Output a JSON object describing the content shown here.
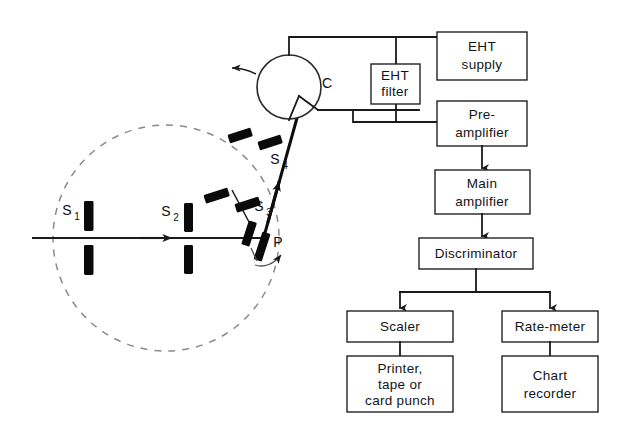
{
  "figure": {
    "type": "diagram",
    "background_color": "#ffffff",
    "line_color": "#1a1a1a",
    "dashed_circle_color": "#8a8a8a"
  },
  "optics": {
    "incident_beam_label": "incident-beam",
    "specimen": {
      "label": "P",
      "name": "specimen"
    },
    "detector": {
      "label": "C",
      "name": "counter"
    },
    "slits": [
      {
        "id": "s1",
        "label": "S",
        "subscript": "1",
        "name": "divergence-slit"
      },
      {
        "id": "s2",
        "label": "S",
        "subscript": "2",
        "name": "scatter-slit"
      },
      {
        "id": "s3",
        "label": "S",
        "subscript": "3",
        "name": "receiving-slit"
      },
      {
        "id": "s4",
        "label": "S",
        "subscript": "4",
        "name": "detector-slit"
      }
    ],
    "focusing_circle_name": "focusing-circle",
    "rotation_arrow_name": "detector-rotation-arrow",
    "specimen_rotation_arrow_name": "specimen-rotation-arrow"
  },
  "blocks": [
    {
      "id": "eht_supply",
      "label": "EHT\nsupply",
      "lines": [
        "EHT",
        "supply"
      ]
    },
    {
      "id": "eht_filter",
      "label": "EHT\nfilter",
      "lines": [
        "EHT",
        "filter"
      ]
    },
    {
      "id": "preamp",
      "label": "Pre-\namplifier",
      "lines": [
        "Pre-",
        "amplifier"
      ]
    },
    {
      "id": "mainamp",
      "label": "Main\namplifier",
      "lines": [
        "Main",
        "amplifier"
      ]
    },
    {
      "id": "discriminator",
      "label": "Discriminator",
      "lines": [
        "Discriminator"
      ]
    },
    {
      "id": "scaler",
      "label": "Scaler",
      "lines": [
        "Scaler"
      ]
    },
    {
      "id": "ratemeter",
      "label": "Rate-meter",
      "lines": [
        "Rate-meter"
      ]
    },
    {
      "id": "printer",
      "label": "Printer,\ntape or\ncard punch",
      "lines": [
        "Printer,",
        "tape or",
        "card punch"
      ]
    },
    {
      "id": "chartrec",
      "label": "Chart\nrecorder",
      "lines": [
        "Chart",
        "recorder"
      ]
    }
  ],
  "block_text": {
    "eht_supply_l1": "EHT",
    "eht_supply_l2": "supply",
    "eht_filter_l1": "EHT",
    "eht_filter_l2": "filter",
    "preamp_l1": "Pre-",
    "preamp_l2": "amplifier",
    "mainamp_l1": "Main",
    "mainamp_l2": "amplifier",
    "discriminator_l1": "Discriminator",
    "scaler_l1": "Scaler",
    "ratemeter_l1": "Rate-meter",
    "printer_l1": "Printer,",
    "printer_l2": "tape or",
    "printer_l3": "card punch",
    "chartrec_l1": "Chart",
    "chartrec_l2": "recorder"
  },
  "part_text": {
    "counter": "C",
    "specimen": "P",
    "s_letter": "S",
    "s1_sub": "1",
    "s2_sub": "2",
    "s3_sub": "3",
    "s4_sub": "4"
  },
  "connections": [
    {
      "from": "counter",
      "to": "eht_filter",
      "name": "counter-to-eht-filter"
    },
    {
      "from": "counter",
      "to": "eht_supply",
      "name": "counter-to-eht-supply"
    },
    {
      "from": "eht_filter",
      "to": "eht_supply",
      "name": "eht-filter-to-supply"
    },
    {
      "from": "eht_filter",
      "to": "preamp",
      "name": "eht-filter-to-preamp"
    },
    {
      "from": "preamp",
      "to": "mainamp",
      "name": "preamp-to-mainamp"
    },
    {
      "from": "mainamp",
      "to": "discriminator",
      "name": "mainamp-to-discriminator"
    },
    {
      "from": "discriminator",
      "to": "scaler",
      "name": "discriminator-to-scaler"
    },
    {
      "from": "discriminator",
      "to": "ratemeter",
      "name": "discriminator-to-ratemeter"
    },
    {
      "from": "scaler",
      "to": "printer",
      "name": "scaler-to-printer"
    },
    {
      "from": "ratemeter",
      "to": "chartrec",
      "name": "ratemeter-to-chart-recorder"
    }
  ]
}
